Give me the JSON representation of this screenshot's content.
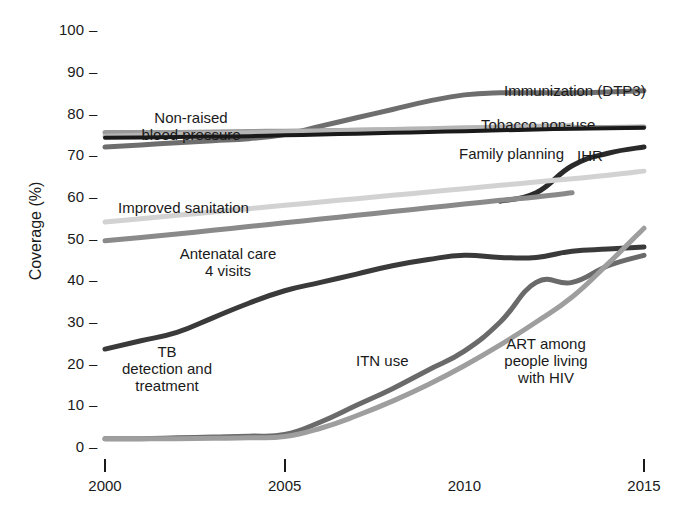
{
  "chart_data": {
    "type": "line",
    "title": "",
    "xlabel": "",
    "ylabel": "Coverage (%)",
    "xlim": [
      2000,
      2015
    ],
    "ylim": [
      0,
      100
    ],
    "grid": false,
    "legend_position": "inline-labels",
    "x_ticks": [
      "2000",
      "2005",
      "2010",
      "2015"
    ],
    "x_tick_values": [
      2000,
      2005,
      2010,
      2015
    ],
    "y_ticks": [
      "0",
      "10",
      "20",
      "30",
      "40",
      "50",
      "60",
      "70",
      "80",
      "90",
      "100"
    ],
    "y_tick_values": [
      0,
      10,
      20,
      30,
      40,
      50,
      60,
      70,
      80,
      90,
      100
    ],
    "series": [
      {
        "name": "Immunization (DTP3)",
        "color": "#6e6e6e",
        "width": 5,
        "x": [
          2000,
          2001,
          2002,
          2003,
          2004,
          2005,
          2006,
          2007,
          2008,
          2009,
          2010,
          2011,
          2012,
          2013,
          2014,
          2015
        ],
        "values": [
          72,
          72.5,
          73,
          73.5,
          74,
          75,
          77,
          79,
          81,
          83,
          84.5,
          85,
          85,
          85,
          85.2,
          85.5
        ]
      },
      {
        "name": "Non-raised blood pressure",
        "color": "#9a9a9a",
        "width": 5,
        "x": [
          2000,
          2001,
          2002,
          2003,
          2004,
          2005,
          2006,
          2007,
          2008,
          2009,
          2010,
          2011,
          2012,
          2013,
          2014,
          2015
        ],
        "values": [
          75.5,
          75.5,
          75.5,
          75.6,
          75.7,
          75.8,
          75.9,
          76,
          76.1,
          76.2,
          76.3,
          76.4,
          76.5,
          76.6,
          76.7,
          76.8
        ]
      },
      {
        "name": "Tobacco non-use",
        "color": "#b5b5b5",
        "width": 5,
        "x": [
          2000,
          2001,
          2002,
          2003,
          2004,
          2005,
          2006,
          2007,
          2008,
          2009,
          2010,
          2011,
          2012,
          2013
        ],
        "values": [
          74.6,
          74.8,
          75,
          75.2,
          75.4,
          75.6,
          75.8,
          76,
          76.2,
          76.4,
          76.6,
          76.8,
          77,
          77.1
        ]
      },
      {
        "name": "Family planning",
        "color": "#1a1a1a",
        "width": 4,
        "x": [
          2000,
          2001,
          2002,
          2003,
          2004,
          2005,
          2006,
          2007,
          2008,
          2009,
          2010,
          2011,
          2012,
          2013,
          2014,
          2015
        ],
        "values": [
          74.2,
          74.3,
          74.4,
          74.5,
          74.6,
          74.8,
          75,
          75.2,
          75.4,
          75.6,
          75.8,
          76,
          76.2,
          76.4,
          76.5,
          76.6
        ]
      },
      {
        "name": "IHR",
        "color": "#2a2a2a",
        "width": 5,
        "x": [
          2011,
          2012,
          2013,
          2014,
          2015
        ],
        "values": [
          59,
          61,
          67.5,
          70.5,
          72
        ]
      },
      {
        "name": "Improved sanitation",
        "color": "#d2d2d2",
        "width": 5,
        "x": [
          2000,
          2001,
          2002,
          2003,
          2004,
          2005,
          2006,
          2007,
          2008,
          2009,
          2010,
          2011,
          2012,
          2013,
          2014,
          2015
        ],
        "values": [
          54,
          54.8,
          55.6,
          56.4,
          57.2,
          58,
          58.8,
          59.6,
          60.4,
          61.2,
          62,
          62.8,
          63.6,
          64.4,
          65.2,
          66.2
        ]
      },
      {
        "name": "Antenatal care 4 visits",
        "color": "#8a8a8a",
        "width": 5,
        "x": [
          2000,
          2001,
          2002,
          2003,
          2004,
          2005,
          2006,
          2007,
          2008,
          2009,
          2010,
          2011,
          2012,
          2013
        ],
        "values": [
          49.5,
          50.3,
          51.1,
          52,
          52.9,
          53.8,
          54.7,
          55.6,
          56.5,
          57.4,
          58.3,
          59.2,
          60,
          61
        ]
      },
      {
        "name": "TB detection and treatment",
        "color": "#3a3a3a",
        "width": 5,
        "x": [
          2000,
          2001,
          2002,
          2003,
          2004,
          2005,
          2006,
          2007,
          2008,
          2009,
          2010,
          2011,
          2012,
          2013,
          2014,
          2015
        ],
        "values": [
          23.5,
          25.5,
          27.5,
          31,
          34.5,
          37.5,
          39.5,
          41.5,
          43.5,
          45,
          46,
          45.5,
          45.5,
          47,
          47.5,
          48
        ]
      },
      {
        "name": "ITN use",
        "color": "#6a6a6a",
        "width": 5,
        "x": [
          2000,
          2001,
          2002,
          2003,
          2004,
          2005,
          2006,
          2007,
          2008,
          2009,
          2010,
          2011,
          2012,
          2013,
          2014,
          2015
        ],
        "values": [
          2,
          2,
          2.2,
          2.4,
          2.6,
          3,
          6,
          10,
          14,
          18.5,
          23,
          30,
          39.5,
          39.5,
          43.5,
          46
        ]
      },
      {
        "name": "ART among people living with HIV",
        "color": "#9e9e9e",
        "width": 5,
        "x": [
          2000,
          2001,
          2002,
          2003,
          2004,
          2005,
          2006,
          2007,
          2008,
          2009,
          2010,
          2011,
          2012,
          2013,
          2014,
          2015
        ],
        "values": [
          2,
          2,
          2,
          2.1,
          2.2,
          2.5,
          4.5,
          7.5,
          11,
          15,
          19.5,
          24.5,
          30,
          36,
          44,
          52.5
        ]
      }
    ],
    "annotations": [
      {
        "id": "immunization",
        "text": "Immunization (DTP3)",
        "x_px": 504,
        "y_px": 82,
        "align": "left"
      },
      {
        "id": "non-raised-bp",
        "text": "Non-raised\nblood pressure",
        "x_px": 191,
        "y_px": 109,
        "align": "center"
      },
      {
        "id": "tobacco",
        "text": "Tobacco non-use",
        "x_px": 481,
        "y_px": 116,
        "align": "left"
      },
      {
        "id": "family-planning",
        "text": "Family planning",
        "x_px": 459,
        "y_px": 145,
        "align": "left"
      },
      {
        "id": "ihr",
        "text": "IHR",
        "x_px": 577,
        "y_px": 147,
        "align": "left"
      },
      {
        "id": "improved-sanitation",
        "text": "Improved sanitation",
        "x_px": 118,
        "y_px": 199,
        "align": "left"
      },
      {
        "id": "antenatal-care",
        "text": "Antenatal care\n4 visits",
        "x_px": 228,
        "y_px": 245,
        "align": "center"
      },
      {
        "id": "tb",
        "text": "TB\ndetection and\ntreatment",
        "x_px": 167,
        "y_px": 343,
        "align": "center"
      },
      {
        "id": "itn-use",
        "text": "ITN use",
        "x_px": 356,
        "y_px": 352,
        "align": "left"
      },
      {
        "id": "art",
        "text": "ART among\npeople living\nwith HIV",
        "x_px": 546,
        "y_px": 335,
        "align": "center"
      }
    ]
  }
}
